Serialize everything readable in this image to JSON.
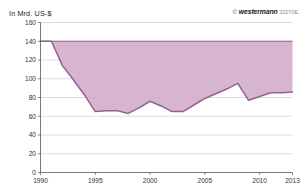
{
  "chart_data": {
    "type": "area",
    "title": "In Mrd. US-$",
    "xlabel": "",
    "ylabel": "In Mrd. US-$",
    "ylim": [
      0,
      160
    ],
    "xlim": [
      1990,
      2013
    ],
    "ytick_labels": [
      "0",
      "20",
      "40",
      "60",
      "80",
      "100",
      "120",
      "140",
      "160"
    ],
    "ytick_values": [
      0,
      20,
      40,
      60,
      80,
      100,
      120,
      140,
      160
    ],
    "xtick_labels": [
      "1990",
      "1995",
      "2000",
      "2005",
      "2010",
      "2013"
    ],
    "xtick_values": [
      1990,
      1995,
      2000,
      2005,
      2010,
      2013
    ],
    "grid": true,
    "legend": "none",
    "baseline_value": 140,
    "fill_color": "#d0a8c8",
    "line_color": "#96608f",
    "x": [
      1990,
      1991,
      1992,
      1993,
      1994,
      1995,
      1996,
      1997,
      1998,
      1999,
      2000,
      2001,
      2002,
      2003,
      2004,
      2005,
      2006,
      2007,
      2008,
      2009,
      2010,
      2011,
      2012,
      2013
    ],
    "series": [
      {
        "name": "Wert",
        "values": [
          140,
          140,
          114,
          99,
          83,
          65,
          66,
          66,
          63,
          69,
          76,
          71,
          65,
          65,
          72,
          79,
          84,
          89,
          95,
          77,
          81,
          85,
          85,
          86
        ]
      }
    ],
    "annotations": []
  },
  "credit": {
    "symbol": "©",
    "brand": "westermann",
    "code": "32070E"
  }
}
